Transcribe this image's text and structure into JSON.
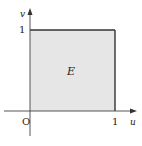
{
  "diagram": {
    "region_label": "E",
    "axes": {
      "x_label": "u",
      "y_label": "v",
      "origin_label": "O"
    },
    "ticks": {
      "x_tick": "1",
      "y_tick": "1"
    },
    "colors": {
      "region_fill": "#e6e6e6",
      "region_stroke": "#333333",
      "axis": "#444444"
    }
  }
}
